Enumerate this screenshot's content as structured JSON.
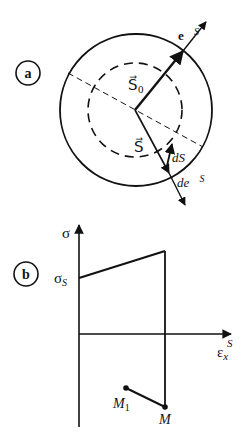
{
  "panel_a": {
    "label": "a",
    "vectors": {
      "S0": "S⃗",
      "S0_sub": "0",
      "S": "S⃗",
      "dS": "dS⃗",
      "eS": "e⃗",
      "eS_sup": "S",
      "deS": "de⃗",
      "deS_sup": "S"
    }
  },
  "panel_b": {
    "label": "b",
    "y_axis": "σ",
    "sigma_s": "σ",
    "sigma_s_sub": "S",
    "x_axis": "ε",
    "x_axis_sub": "x",
    "x_axis_sup": "S",
    "point_M1": "M",
    "point_M1_sub": "1",
    "point_M": "M"
  }
}
